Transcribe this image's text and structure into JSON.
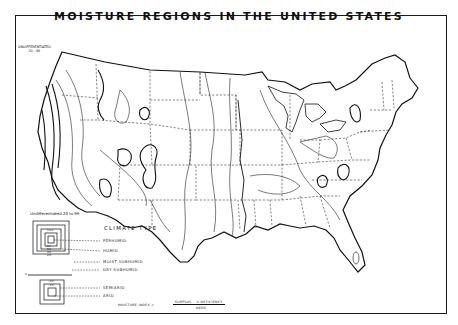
{
  "map": {
    "title": "MOISTURE REGIONS IN THE UNITED STATES",
    "annotation_northwest": [
      "UNDIFFERENTIATED",
      "20 - 99"
    ],
    "formula": {
      "prefix": "MOISTURE INDEX =",
      "numerator": "SURPLUS - .6 DEFICIENCY",
      "denominator": "NEED"
    },
    "colors": {
      "ink": "#111111",
      "paper": "#ffffff"
    }
  },
  "legend": {
    "header": "Undifferentiated 20 to 99",
    "title": "CLIMATE TYPE",
    "humid_box_values": [
      "100",
      "80",
      "60",
      "40",
      "20"
    ],
    "zero_line_value": "0",
    "arid_box_values": [
      "-20",
      "-40"
    ],
    "classes": [
      {
        "label": "PERHUMID",
        "range": "100 and above"
      },
      {
        "label": "HUMID",
        "range": "20 to 100"
      },
      {
        "label": "MOIST SUBHUMID",
        "range": "0 to 20"
      },
      {
        "label": "DRY SUBHUMID",
        "range": "-20 to 0"
      },
      {
        "label": "SEMIARID",
        "range": "-40 to -20"
      },
      {
        "label": "ARID",
        "range": "below -40"
      }
    ]
  }
}
